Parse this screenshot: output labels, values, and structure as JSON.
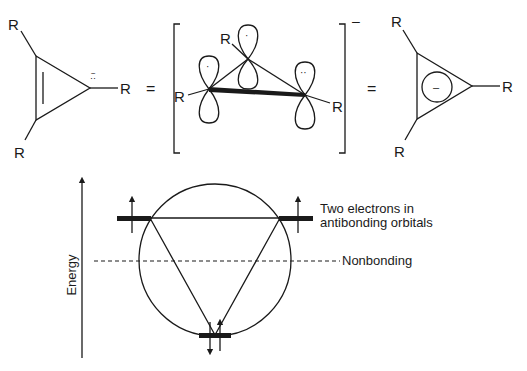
{
  "structures": {
    "left": {
      "substituent_labels": [
        "R",
        "R",
        "R"
      ],
      "lone_pair_mark": "··",
      "charge_mark": "−"
    },
    "equals_1": "=",
    "middle": {
      "substituent_labels": [
        "R",
        "R",
        "R"
      ],
      "bracket_charge": "–",
      "p_orbital_electrons": [
        "·",
        "·",
        "··"
      ]
    },
    "equals_2": "=",
    "right": {
      "substituent_labels": [
        "R",
        "R",
        "R"
      ],
      "ring_charge": "–"
    }
  },
  "energy_diagram": {
    "axis_label": "Energy",
    "annotations": {
      "antibonding_line1": "Two electrons in",
      "antibonding_line2": "antibonding orbitals",
      "nonbonding": "Nonbonding"
    },
    "levels": [
      {
        "name": "bonding",
        "electrons": 2,
        "spins": [
          "down",
          "up"
        ]
      },
      {
        "name": "antibonding-left",
        "electrons": 1,
        "spins": [
          "up"
        ]
      },
      {
        "name": "antibonding-right",
        "electrons": 1,
        "spins": [
          "up"
        ]
      }
    ],
    "colors": {
      "ink": "#1a1a1a",
      "background": "#ffffff"
    }
  }
}
